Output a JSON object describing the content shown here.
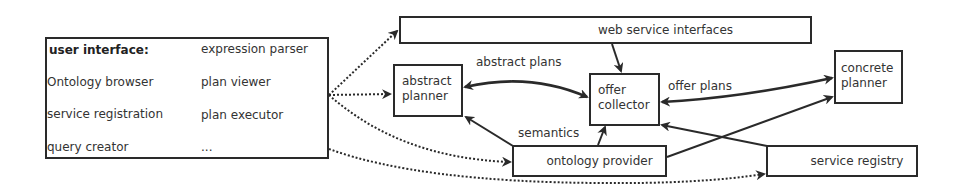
{
  "user_interface": {
    "title": "user interface:",
    "items_left": [
      "Ontology browser",
      "service registration",
      "query creator"
    ],
    "items_right": [
      "expression parser",
      "plan viewer",
      "plan executor",
      "..."
    ]
  },
  "nodes": {
    "web_service_interfaces": "web service interfaces",
    "abstract_planner_line1": "abstract",
    "abstract_planner_line2": "planner",
    "offer_collector_line1": "offer",
    "offer_collector_line2": "collector",
    "concrete_planner_line1": "concrete",
    "concrete_planner_line2": "planner",
    "ontology_provider": "ontology provider",
    "service_registry": "service registry"
  },
  "edge_labels": {
    "abstract_plans": "abstract plans",
    "offer_plans": "offer plans",
    "semantics": "semantics"
  },
  "colors": {
    "stroke": "#2a2a2a",
    "background": "#ffffff"
  }
}
